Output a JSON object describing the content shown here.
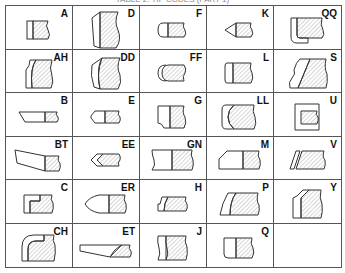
{
  "caption": "TABLE 2: TIP CODES (PART 1)",
  "grid": {
    "columns": 5,
    "rows": 6,
    "line_color": "#555555",
    "hatch_color": "#888888"
  },
  "cells": [
    {
      "code": "A",
      "shape": "square-tip"
    },
    {
      "code": "D",
      "shape": "wide-bevel-tip"
    },
    {
      "code": "F",
      "shape": "round-nose-tip"
    },
    {
      "code": "K",
      "shape": "pointed-tip"
    },
    {
      "code": "QQ",
      "shape": "hook-tip"
    },
    {
      "code": "AH",
      "shape": "concave-bevel-tip"
    },
    {
      "code": "DD",
      "shape": "double-concave-tip"
    },
    {
      "code": "FF",
      "shape": "double-round-tip"
    },
    {
      "code": "L",
      "shape": "round-corner-tip"
    },
    {
      "code": "S",
      "shape": "ogee-slant-tip"
    },
    {
      "code": "B",
      "shape": "long-bevel-tip"
    },
    {
      "code": "E",
      "shape": "chamfer-point-tip"
    },
    {
      "code": "G",
      "shape": "stepped-corner-tip"
    },
    {
      "code": "LL",
      "shape": "deep-concave-tip"
    },
    {
      "code": "U",
      "shape": "inset-square-tip"
    },
    {
      "code": "BT",
      "shape": "long-taper-tip"
    },
    {
      "code": "EE",
      "shape": "double-chevron-tip"
    },
    {
      "code": "GN",
      "shape": "notched-ends-tip"
    },
    {
      "code": "M",
      "shape": "angled-corner-tip"
    },
    {
      "code": "V",
      "shape": "parallel-slant-tip"
    },
    {
      "code": "C",
      "shape": "stepped-offset-tip"
    },
    {
      "code": "ER",
      "shape": "curved-point-tip"
    },
    {
      "code": "H",
      "shape": "notched-slant-tip"
    },
    {
      "code": "P",
      "shape": "curved-slant-tip"
    },
    {
      "code": "Y",
      "shape": "offset-slant-tip"
    },
    {
      "code": "CH",
      "shape": "rounded-hook-tip"
    },
    {
      "code": "ET",
      "shape": "long-slant-tip"
    },
    {
      "code": "J",
      "shape": "concave-ends-tip"
    },
    {
      "code": "Q",
      "shape": "rounded-corner-square-tip"
    },
    {
      "code": "",
      "shape": "empty"
    }
  ]
}
